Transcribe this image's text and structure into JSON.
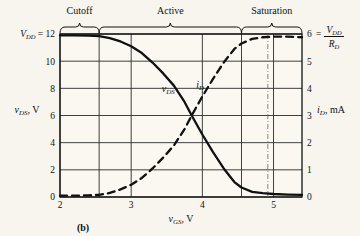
{
  "figure": {
    "caption": "(b)",
    "background": "#f7f5ee",
    "ink": "#111111"
  },
  "axes": {
    "x": {
      "label_var": "v",
      "label_sub": "GS",
      "label_unit": ", V",
      "ticks": [
        "2",
        "3",
        "4",
        "5"
      ],
      "tick_values": [
        2,
        3,
        4,
        5
      ],
      "min": 2,
      "max": 5.4
    },
    "y_left": {
      "label_var": "v",
      "label_sub": "DS",
      "label_unit": ", V",
      "ticks": [
        "0",
        "2",
        "4",
        "6",
        "8",
        "10",
        "12"
      ],
      "tick_values": [
        0,
        2,
        4,
        6,
        8,
        10,
        12
      ],
      "min": 0,
      "max": 12,
      "top_annotation_var": "V",
      "top_annotation_sub": "DD",
      "top_annotation_eq": "= 12"
    },
    "y_right": {
      "label_var": "i",
      "label_sub": "D",
      "label_unit": ", mA",
      "ticks": [
        "0",
        "1",
        "2",
        "3",
        "4",
        "5",
        "6"
      ],
      "tick_values": [
        0,
        1,
        2,
        3,
        4,
        5,
        6
      ],
      "min": 0,
      "max": 6,
      "top_annotation_eq": "=",
      "top_annotation_num_var": "V",
      "top_annotation_num_sub": "DD",
      "top_annotation_den_var": "R",
      "top_annotation_den_sub": "D"
    }
  },
  "regions": [
    {
      "name": "cutoff",
      "label": "Cutoff",
      "x_start": 2.0,
      "x_end": 2.55
    },
    {
      "name": "active",
      "label": "Active",
      "x_start": 2.55,
      "x_end": 4.55
    },
    {
      "name": "saturation",
      "label": "Saturation",
      "x_start": 4.55,
      "x_end": 5.4
    }
  ],
  "curve_labels": [
    {
      "name": "vds",
      "var": "v",
      "sub": "DS",
      "x": 3.52,
      "y_px": 92
    },
    {
      "name": "id",
      "var": "i",
      "sub": "D",
      "x": 3.97,
      "y_px": 88
    }
  ],
  "markers": {
    "dash_dot_vline_x": 4.92,
    "crossing_point": {
      "x": 3.85,
      "vds": 6.0,
      "id": 3.0
    }
  },
  "chart_data": {
    "type": "line",
    "title": "",
    "xlabel": "v_GS, V",
    "ylabel": "v_DS, V",
    "ylabel_right": "i_D, mA",
    "xlim": [
      2,
      5.4
    ],
    "ylim": [
      0,
      12
    ],
    "ylim_right": [
      0,
      6
    ],
    "grid": true,
    "legend": "inline-curve-labels",
    "xticks": [
      2,
      3,
      4,
      5
    ],
    "yticks_left": [
      0,
      2,
      4,
      6,
      8,
      10,
      12
    ],
    "yticks_right": [
      0,
      1,
      2,
      3,
      4,
      5,
      6
    ],
    "series": [
      {
        "name": "v_DS",
        "style": "solid",
        "axis": "left",
        "units": "V",
        "x": [
          2.0,
          2.2,
          2.4,
          2.55,
          2.7,
          2.85,
          3.0,
          3.15,
          3.3,
          3.45,
          3.6,
          3.75,
          3.85,
          4.0,
          4.15,
          4.3,
          4.45,
          4.55,
          4.7,
          4.85,
          5.0,
          5.2,
          5.4
        ],
        "values": [
          11.9,
          11.9,
          11.88,
          11.85,
          11.7,
          11.45,
          11.1,
          10.6,
          9.9,
          9.1,
          8.2,
          7.0,
          6.0,
          4.6,
          3.3,
          2.1,
          1.1,
          0.7,
          0.38,
          0.28,
          0.22,
          0.18,
          0.15
        ]
      },
      {
        "name": "i_D",
        "style": "dashed",
        "axis": "right",
        "units": "mA",
        "x": [
          2.0,
          2.2,
          2.4,
          2.55,
          2.7,
          2.85,
          3.0,
          3.15,
          3.3,
          3.45,
          3.6,
          3.75,
          3.85,
          4.0,
          4.15,
          4.3,
          4.45,
          4.55,
          4.7,
          4.85,
          5.0,
          5.2,
          5.4
        ],
        "values": [
          0.05,
          0.05,
          0.06,
          0.08,
          0.15,
          0.28,
          0.45,
          0.7,
          1.05,
          1.45,
          1.9,
          2.5,
          3.0,
          3.7,
          4.35,
          4.95,
          5.45,
          5.65,
          5.82,
          5.88,
          5.9,
          5.9,
          5.88
        ]
      }
    ]
  }
}
